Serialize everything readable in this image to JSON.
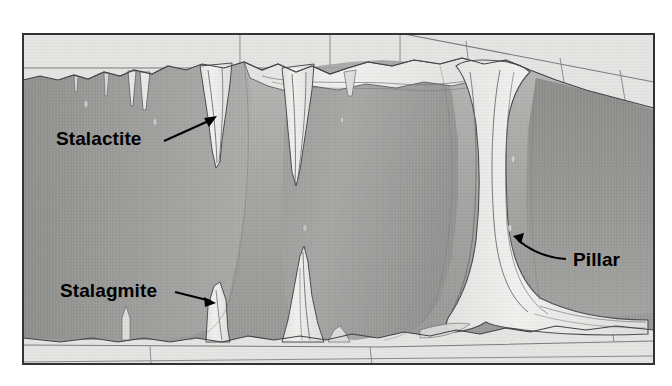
{
  "figure": {
    "kind": "cross-section-diagram",
    "frame": {
      "x": 22,
      "y": 33,
      "width": 633,
      "height": 332,
      "border_color": "#333333",
      "border_width": 2
    },
    "background_color": "#ffffff"
  },
  "palette": {
    "page_background": "#ffffff",
    "bedrock_light": "#e3e3e1",
    "bedrock_light_alt": "#dedede",
    "joint_line": "#6b6b6b",
    "cave_fill_light": "#b4b4b4",
    "cave_fill_mid": "#a2a2a2",
    "cave_fill_dark": "#8e8e8e",
    "cave_fill_darkest": "#868686",
    "formation_fill": "#ececea",
    "formation_line": "#4a4a4a",
    "outline": "#3b3b3b",
    "label_text": "#000000",
    "arrow_color": "#000000"
  },
  "labels": [
    {
      "id": "stalactite",
      "text": "Stalactite",
      "text_x": 56,
      "text_y": 145,
      "anchor": "start",
      "arrow": {
        "from_x": 164,
        "from_y": 141,
        "to_x": 217,
        "to_y": 117,
        "curved": false
      },
      "points_at": "ceiling-hanging-formation"
    },
    {
      "id": "stalagmite",
      "text": "Stalagmite",
      "text_x": 60,
      "text_y": 297,
      "anchor": "start",
      "arrow": {
        "from_x": 175,
        "from_y": 292,
        "to_x": 215,
        "to_y": 303,
        "curved": false
      },
      "points_at": "floor-rising-formation"
    },
    {
      "id": "pillar",
      "text": "Pillar",
      "text_x": 573,
      "text_y": 266,
      "anchor": "start",
      "arrow": {
        "from_x": 566,
        "from_y": 259,
        "to_x": 513,
        "to_y": 238,
        "curved": true
      },
      "points_at": "floor-to-ceiling-column"
    }
  ],
  "features": {
    "bedrock_top": {
      "name": "upper-limestone-beds",
      "bedding_planes": 2,
      "vertical_joints_x": [
        240,
        400,
        470,
        560
      ]
    },
    "bedrock_bottom": {
      "name": "lower-limestone-beds",
      "bedding_planes": 2,
      "vertical_joints_x": [
        150,
        370,
        610
      ]
    },
    "stalactites_count": 6,
    "stalagmites_count": 4,
    "pillars_count": 1
  }
}
